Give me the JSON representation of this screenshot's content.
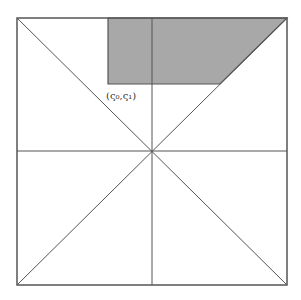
{
  "diagram": {
    "label": "(ς₀,ς₁)",
    "colors": {
      "line": "#555555",
      "shade": "#a8a8a8",
      "background": "#ffffff"
    },
    "square": {
      "x0": 17,
      "y0": 18,
      "x1": 287,
      "y1": 285
    },
    "shaded_region": {
      "left": 108,
      "top": 18,
      "bottom": 84,
      "diag_x_at_bottom": 220
    }
  }
}
